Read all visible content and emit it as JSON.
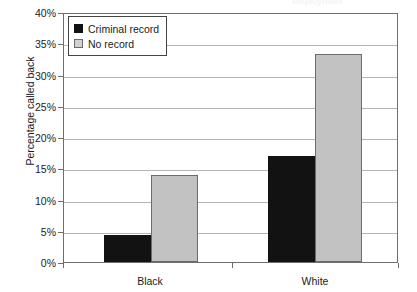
{
  "chart_data": {
    "type": "bar",
    "title": "",
    "title_remnant": "employment",
    "xlabel": "",
    "ylabel": "Percentage called back",
    "categories": [
      "Black",
      "White"
    ],
    "series": [
      {
        "name": "Criminal record",
        "color": "#121212",
        "values": [
          4.3,
          17.0
        ]
      },
      {
        "name": "No record",
        "color": "#c2c2c2",
        "values": [
          14.0,
          33.3
        ]
      }
    ],
    "ylim": [
      0,
      40
    ],
    "ytick_step": 5,
    "ytick_labels": [
      "0%",
      "5%",
      "10%",
      "15%",
      "20%",
      "25%",
      "30%",
      "35%",
      "40%"
    ],
    "grid": true,
    "legend_position": "top-left"
  },
  "legend": {
    "items": [
      {
        "label": "Criminal record",
        "swatch": "dark"
      },
      {
        "label": "No record",
        "swatch": "light"
      }
    ]
  },
  "axis": {
    "y_title": "Percentage called back",
    "x_labels": [
      "Black",
      "White"
    ],
    "y_labels": [
      "40%",
      "35%",
      "30%",
      "25%",
      "20%",
      "15%",
      "10%",
      "5%",
      "0%"
    ]
  },
  "colors": {
    "criminal_record": "#121212",
    "no_record": "#c2c2c2",
    "gridline": "#b4b4b4",
    "frame": "#6e6e6e",
    "text": "#1b1b1b"
  }
}
